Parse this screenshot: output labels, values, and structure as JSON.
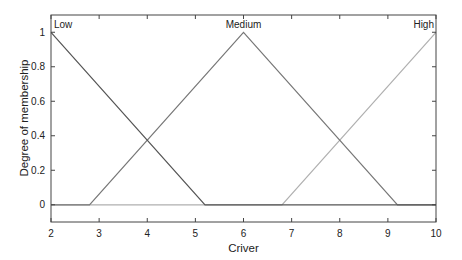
{
  "chart_data": {
    "type": "line",
    "title": "",
    "xlabel": "Criver",
    "ylabel": "Degree of membership",
    "xlim": [
      2,
      10
    ],
    "ylim": [
      -0.1,
      1.1
    ],
    "xticks": [
      2,
      3,
      4,
      5,
      6,
      7,
      8,
      9,
      10
    ],
    "yticks": [
      0,
      0.2,
      0.4,
      0.6,
      0.8,
      1
    ],
    "ytick_labels": [
      "0",
      "0.2",
      "0.4",
      "0.6",
      "0.8",
      "1"
    ],
    "grid": false,
    "legend": "none (inline labels)",
    "series": [
      {
        "name": "Low",
        "color": "#555555",
        "x": [
          2,
          5.2,
          10
        ],
        "y": [
          1,
          0,
          0
        ],
        "label_pos": "top-left"
      },
      {
        "name": "Medium",
        "color": "#777777",
        "x": [
          2,
          2.8,
          6,
          9.2,
          10
        ],
        "y": [
          0,
          0,
          1,
          0,
          0
        ],
        "label_pos": "top-center"
      },
      {
        "name": "High",
        "color": "#b0b0b0",
        "x": [
          2,
          6.8,
          10
        ],
        "y": [
          0,
          0,
          1
        ],
        "label_pos": "top-right"
      }
    ]
  }
}
